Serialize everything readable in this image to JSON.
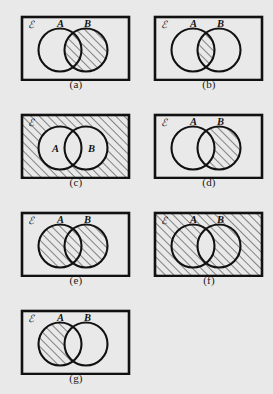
{
  "figure": {
    "background_color": "#e9e9e9",
    "ink_color": "#111111",
    "hatch_color": "#2b2b2b",
    "circle_fill": "#e9e9e9",
    "universe_label": "ℰ",
    "set_a_label": "A",
    "set_b_label": "B",
    "panels": [
      {
        "id": "a",
        "caption": "(a)",
        "shaded_region": "B",
        "label_position": "outside-top",
        "regions": {
          "a_only": false,
          "intersection": true,
          "b_only": true,
          "outside": false
        }
      },
      {
        "id": "b",
        "caption": "(b)",
        "shaded_region": "A ∩ B",
        "label_position": "outside-top",
        "regions": {
          "a_only": false,
          "intersection": true,
          "b_only": false,
          "outside": false
        }
      },
      {
        "id": "c",
        "caption": "(c)",
        "shaded_region": "(A ∪ B)'",
        "label_position": "inside-circles",
        "regions": {
          "a_only": false,
          "intersection": false,
          "b_only": false,
          "outside": true
        }
      },
      {
        "id": "d",
        "caption": "(d)",
        "shaded_region": "B − A",
        "label_position": "outside-top",
        "regions": {
          "a_only": false,
          "intersection": false,
          "b_only": true,
          "outside": false
        }
      },
      {
        "id": "e",
        "caption": "(e)",
        "shaded_region": "A ∪ B",
        "label_position": "outside-top",
        "regions": {
          "a_only": true,
          "intersection": true,
          "b_only": true,
          "outside": false
        }
      },
      {
        "id": "f",
        "caption": "(f)",
        "shaded_region": "(A ∩ B)'",
        "label_position": "outside-top",
        "regions": {
          "a_only": true,
          "intersection": false,
          "b_only": true,
          "outside": true
        }
      },
      {
        "id": "g",
        "caption": "(g)",
        "shaded_region": "A − B",
        "label_position": "outside-top",
        "regions": {
          "a_only": true,
          "intersection": false,
          "b_only": false,
          "outside": false
        }
      }
    ]
  }
}
